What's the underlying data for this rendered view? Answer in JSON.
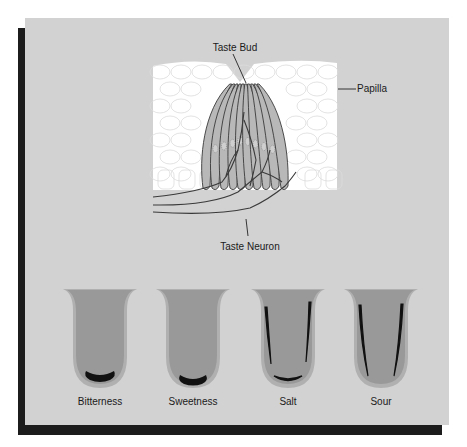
{
  "colors": {
    "panel": "#d2d2d2",
    "shadow": "#1c1c1c",
    "epithelium": "#ffffff",
    "cell_outline": "#dcdcdc",
    "bud_fill": "#b8b8b8",
    "bud_outline": "#3a3a3a",
    "tongue_rim": "#b0b0b0",
    "tongue_body": "#999999",
    "taste_region": "#111111"
  },
  "labels": {
    "taste_bud": "Taste Bud",
    "papilla": "Papilla",
    "taste_neuron": "Taste Neuron"
  },
  "tongues": [
    {
      "label": "Bitterness",
      "region": "back"
    },
    {
      "label": "Sweetness",
      "region": "tip"
    },
    {
      "label": "Salt",
      "region": "sides-and-tip"
    },
    {
      "label": "Sour",
      "region": "sides"
    }
  ]
}
